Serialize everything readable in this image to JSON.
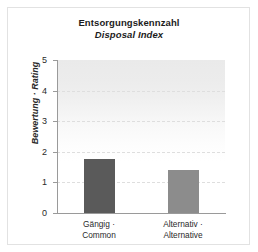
{
  "chart_data": {
    "type": "bar",
    "title": "Entsorgungskennzahl",
    "subtitle": "Disposal Index",
    "xlabel": "",
    "ylabel": "Bewertung · Rating",
    "ylim": [
      0,
      5
    ],
    "yticks": [
      "0",
      "1",
      "2",
      "3",
      "4",
      "5"
    ],
    "grid": "horizontal-dashed",
    "legend": "none",
    "categories": [
      "Gängig · Common",
      "Alternativ · Alternative"
    ],
    "category_lines": [
      [
        "Gängig ·",
        "Common"
      ],
      [
        "Alternativ ·",
        "Alternative"
      ]
    ],
    "values": [
      1.75,
      1.4
    ],
    "bar_colors": [
      "#5a5a5a",
      "#8c8c8c"
    ],
    "axis_color": "#9a9a9a",
    "gridline_color": "#dedede",
    "text_color": "#2a2a2a"
  }
}
